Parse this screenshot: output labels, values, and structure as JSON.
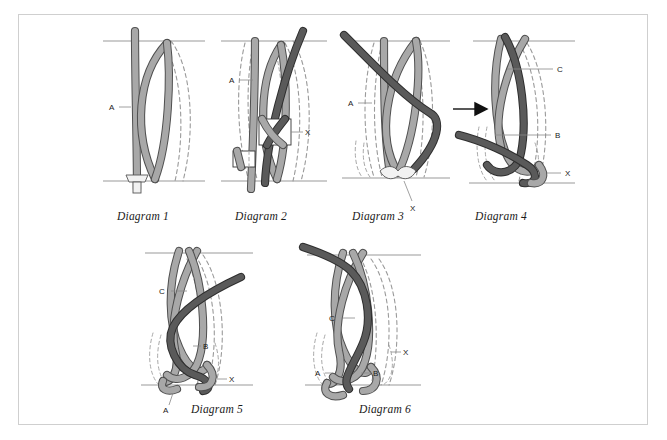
{
  "figure": {
    "title": "",
    "background_color": "#ffffff",
    "frame_color": "#cfcfcf",
    "rope_light_color": "#a8a8a8",
    "rope_dark_color": "#5a5a5a",
    "hidden_line_color": "#9a9a9a",
    "label_color": "#1a1a1a"
  },
  "diagrams": [
    {
      "id": "diagram-1",
      "caption": "Diagram 1",
      "labels": [
        {
          "key": "A",
          "text": "A"
        }
      ]
    },
    {
      "id": "diagram-2",
      "caption": "Diagram 2",
      "labels": [
        {
          "key": "A",
          "text": "A"
        },
        {
          "key": "X",
          "text": "X"
        }
      ]
    },
    {
      "id": "diagram-3",
      "caption": "Diagram 3",
      "labels": [
        {
          "key": "A",
          "text": "A"
        },
        {
          "key": "X",
          "text": "X"
        }
      ]
    },
    {
      "id": "diagram-4",
      "caption": "Diagram 4",
      "labels": [
        {
          "key": "C",
          "text": "C"
        },
        {
          "key": "B",
          "text": "B"
        },
        {
          "key": "X",
          "text": "X"
        }
      ]
    },
    {
      "id": "diagram-5",
      "caption": "Diagram 5",
      "labels": [
        {
          "key": "C",
          "text": "C"
        },
        {
          "key": "B",
          "text": "B"
        },
        {
          "key": "X",
          "text": "X"
        },
        {
          "key": "A",
          "text": "A"
        }
      ]
    },
    {
      "id": "diagram-6",
      "caption": "Diagram 6",
      "labels": [
        {
          "key": "C",
          "text": "C"
        },
        {
          "key": "X",
          "text": "X"
        },
        {
          "key": "A",
          "text": "A"
        },
        {
          "key": "B",
          "text": "B"
        }
      ]
    }
  ]
}
